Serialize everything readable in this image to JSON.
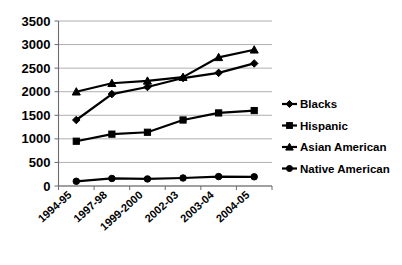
{
  "chart_data": {
    "type": "line",
    "title": "",
    "subtitle": "",
    "xlabel": "",
    "ylabel": "",
    "ylim": [
      0,
      3500
    ],
    "ytick_values": [
      0,
      500,
      1000,
      1500,
      2000,
      2500,
      3000,
      3500
    ],
    "ytick_labels": [
      "0",
      "500",
      "1000",
      "1500",
      "2000",
      "2500",
      "3000",
      "3500"
    ],
    "grid": true,
    "legend_position": "right",
    "categories": [
      "1994-95",
      "1997-98",
      "1999-2000",
      "2002-03",
      "2003-04",
      "2004-05"
    ],
    "series": [
      {
        "name": "Blacks",
        "marker": "diamond",
        "values": [
          1400,
          1950,
          2100,
          2290,
          2400,
          2600
        ]
      },
      {
        "name": "Hispanic",
        "marker": "square",
        "values": [
          950,
          1100,
          1140,
          1400,
          1550,
          1600
        ]
      },
      {
        "name": "Asian American",
        "marker": "triangle",
        "values": [
          2000,
          2180,
          2230,
          2310,
          2730,
          2890
        ]
      },
      {
        "name": "Native American",
        "marker": "circle",
        "values": [
          100,
          160,
          150,
          170,
          200,
          195
        ]
      }
    ]
  },
  "legend": {
    "items": [
      {
        "label": "Blacks",
        "marker": "diamond"
      },
      {
        "label": "Hispanic",
        "marker": "square"
      },
      {
        "label": "Asian American",
        "marker": "triangle"
      },
      {
        "label": "Native American",
        "marker": "circle"
      }
    ]
  },
  "colors": {
    "series": "#000000",
    "gridline": "#9a9a9a",
    "axis": "#6b6b6b",
    "background": "#ffffff",
    "text": "#000000"
  }
}
